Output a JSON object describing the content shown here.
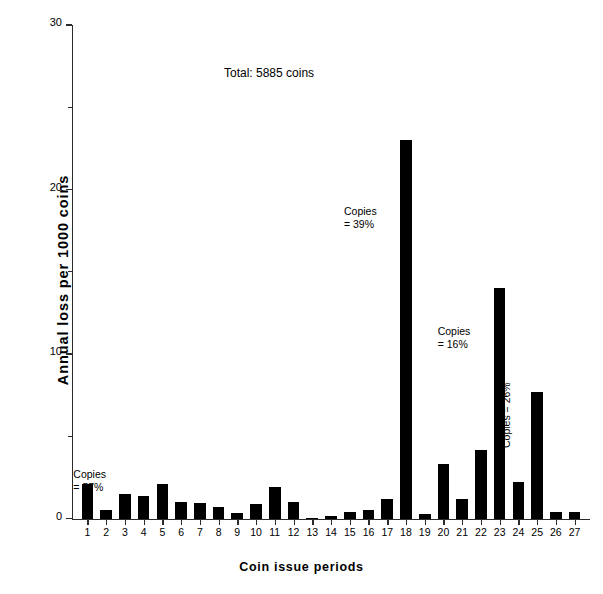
{
  "figure": {
    "total_label": "Total:  5885 coins",
    "caption": ""
  },
  "chart_data": {
    "type": "bar",
    "title": "",
    "subtitle": "",
    "xlabel": "Coin issue periods",
    "ylabel": "Annual loss per 1000 coins",
    "categories": [
      "1",
      "2",
      "3",
      "4",
      "5",
      "6",
      "7",
      "8",
      "9",
      "10",
      "11",
      "12",
      "13",
      "14",
      "15",
      "16",
      "17",
      "18",
      "19",
      "20",
      "21",
      "22",
      "23",
      "24",
      "25",
      "26",
      "27"
    ],
    "values": [
      2.1,
      0.5,
      1.5,
      1.4,
      2.1,
      1.0,
      0.95,
      0.7,
      0.35,
      0.9,
      1.9,
      1.0,
      0.05,
      0.15,
      0.4,
      0.5,
      1.2,
      23.0,
      0.3,
      3.3,
      1.2,
      4.2,
      14.0,
      2.2,
      7.7,
      0.4,
      0.4
    ],
    "ylim": [
      0,
      30
    ],
    "ytick_major": [
      0,
      10,
      20,
      30
    ],
    "ytick_minor": [
      5,
      15,
      25
    ],
    "ytick_labels": [
      "0",
      "10",
      "20",
      "30"
    ],
    "grid": false,
    "legend": null,
    "bar_color": "#000000",
    "annotations": [
      {
        "id": "copies-57",
        "text": "Copies\n= 57%",
        "category": "1",
        "value": 57,
        "rotated": false
      },
      {
        "id": "copies-39",
        "text": "Copies\n= 39%",
        "category": "18",
        "value": 39,
        "rotated": false
      },
      {
        "id": "copies-16",
        "text": "Copies\n= 16%",
        "category": "23",
        "value": 16,
        "rotated": false
      },
      {
        "id": "copies-26",
        "text": "Copies = 26%",
        "category": "24",
        "value": 26,
        "rotated": true
      }
    ]
  }
}
